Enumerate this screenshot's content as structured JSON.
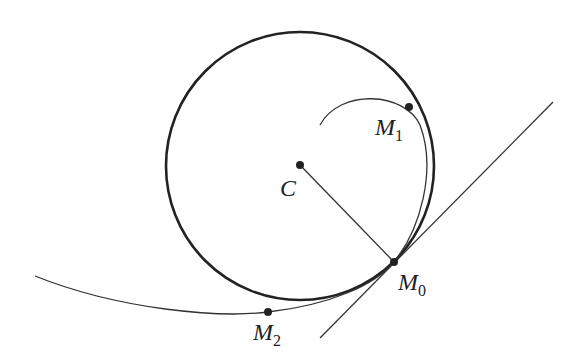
{
  "figure": {
    "labels": {
      "C": {
        "main": "C",
        "sub": ""
      },
      "M0": {
        "main": "M",
        "sub": "0"
      },
      "M1": {
        "main": "M",
        "sub": "1"
      },
      "M2": {
        "main": "M",
        "sub": "2"
      }
    },
    "colors": {
      "stroke": "#222222",
      "background": "#ffffff"
    }
  }
}
